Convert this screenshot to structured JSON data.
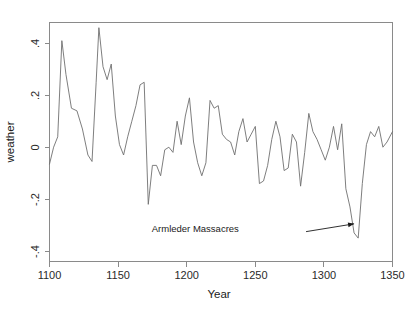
{
  "figure": {
    "background_color": "#ffffff",
    "line_color": "#6f6f6f",
    "axis_color": "#8a8a8a",
    "text_color": "#1a1a1a"
  },
  "chart_data": {
    "type": "line",
    "title": "",
    "subtitle": "",
    "xlabel": "Year",
    "ylabel": "weather",
    "xlim": [
      1100,
      1350
    ],
    "ylim": [
      -0.42,
      0.5
    ],
    "grid": false,
    "legend": null,
    "legend_position": "none",
    "xticks": [
      1100,
      1150,
      1200,
      1250,
      1300,
      1350
    ],
    "xtick_labels": [
      "1100",
      "1150",
      "1200",
      "1250",
      "1300",
      "1350"
    ],
    "yticks": [
      0.4,
      0.2,
      0,
      -0.2,
      -0.4
    ],
    "ytick_labels": [
      ".4",
      ".2",
      "0",
      "-.2",
      "-.4"
    ],
    "series": [
      {
        "name": "weather",
        "x": [
          1100,
          1103,
          1106,
          1109,
          1112,
          1116,
          1120,
          1124,
          1128,
          1131,
          1134,
          1136,
          1139,
          1142,
          1145,
          1148,
          1151,
          1154,
          1157,
          1160,
          1163,
          1166,
          1169,
          1172,
          1175,
          1178,
          1181,
          1184,
          1187,
          1190,
          1193,
          1196,
          1199,
          1202,
          1205,
          1208,
          1211,
          1214,
          1217,
          1220,
          1223,
          1226,
          1229,
          1232,
          1235,
          1238,
          1241,
          1244,
          1247,
          1250,
          1253,
          1256,
          1259,
          1262,
          1265,
          1268,
          1271,
          1274,
          1277,
          1280,
          1283,
          1286,
          1289,
          1292,
          1295,
          1298,
          1301,
          1304,
          1307,
          1310,
          1313,
          1316,
          1319,
          1322,
          1325,
          1328,
          1331,
          1334,
          1337,
          1340,
          1343,
          1346,
          1350
        ],
        "y": [
          -0.045,
          0.02,
          0.06,
          0.43,
          0.3,
          0.17,
          0.16,
          0.09,
          -0.01,
          -0.035,
          0.27,
          0.48,
          0.33,
          0.28,
          0.34,
          0.14,
          0.03,
          -0.01,
          0.06,
          0.12,
          0.18,
          0.26,
          0.27,
          -0.2,
          -0.05,
          -0.05,
          -0.09,
          0.01,
          0.02,
          0.0,
          0.12,
          0.03,
          0.14,
          0.21,
          0.04,
          -0.04,
          -0.09,
          -0.04,
          0.2,
          0.17,
          0.18,
          0.07,
          0.05,
          0.04,
          -0.01,
          0.08,
          0.13,
          0.04,
          0.07,
          0.1,
          -0.12,
          -0.11,
          -0.05,
          0.05,
          0.12,
          0.06,
          -0.07,
          -0.06,
          0.07,
          0.04,
          -0.13,
          0.0,
          0.15,
          0.08,
          0.05,
          0.01,
          -0.03,
          0.02,
          0.1,
          0.01,
          0.11,
          -0.14,
          -0.21,
          -0.31,
          -0.33,
          -0.12,
          0.03,
          0.08,
          0.06,
          0.1,
          0.02,
          0.04,
          0.08
        ]
      }
    ],
    "annotations": [
      {
        "label": "Armleder Massacres",
        "text_x": 1238,
        "text_y": -0.305,
        "arrow_from_x": 1287,
        "arrow_from_y": -0.305,
        "arrow_to_x": 1322,
        "arrow_to_y": -0.275
      }
    ]
  }
}
